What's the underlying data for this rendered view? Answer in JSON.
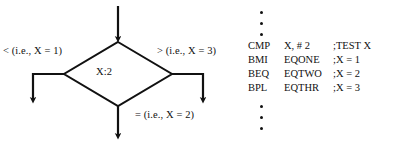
{
  "diagram": {
    "type": "flowchart-with-code-listing",
    "flowchart": {
      "decision_node_label": "X:2",
      "branches": {
        "left_label": "< (i.e., X = 1)",
        "right_label": "> (i.e., X = 3)",
        "bottom_label": "= (i.e., X = 2)"
      }
    },
    "code_listing": {
      "ellipsis_top": [
        "dot",
        "dot",
        "dot"
      ],
      "ellipsis_bottom": [
        "dot",
        "dot",
        "dot"
      ],
      "lines": [
        {
          "op": "CMP",
          "arg": "X, # 2",
          "comment": ";TEST X"
        },
        {
          "op": "BMI",
          "arg": "EQONE",
          "comment": ";X = 1"
        },
        {
          "op": "BEQ",
          "arg": "EQTWO",
          "comment": ";X = 2"
        },
        {
          "op": "BPL",
          "arg": "EQTHR",
          "comment": ";X = 3"
        }
      ]
    },
    "colors": {
      "ink": "#111111",
      "background": "#ffffff"
    }
  }
}
